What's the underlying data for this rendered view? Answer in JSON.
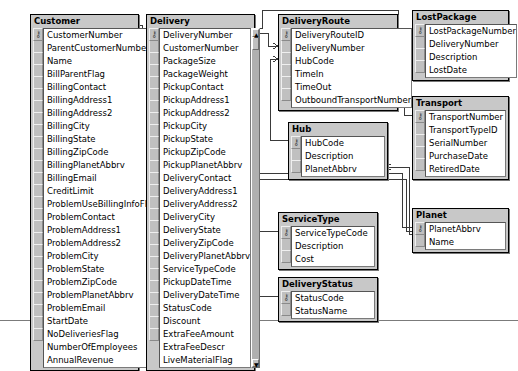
{
  "diagram": {
    "notation": "crow-foot",
    "tables": [
      {
        "name": "Customer",
        "x": 30,
        "y": 14,
        "w": 107,
        "scroll": true,
        "scroll_thumb_top": true,
        "fields": [
          {
            "name": "CustomerNumber",
            "key": true
          },
          {
            "name": "ParentCustomerNumber",
            "key": false
          },
          {
            "name": "Name",
            "key": false
          },
          {
            "name": "BillParentFlag",
            "key": false
          },
          {
            "name": "BillingContact",
            "key": false
          },
          {
            "name": "BillingAddress1",
            "key": false
          },
          {
            "name": "BillingAddress2",
            "key": false
          },
          {
            "name": "BillingCity",
            "key": false
          },
          {
            "name": "BillingState",
            "key": false
          },
          {
            "name": "BillingZipCode",
            "key": false
          },
          {
            "name": "BillingPlanetAbbrv",
            "key": false
          },
          {
            "name": "BillingEmail",
            "key": false
          },
          {
            "name": "CreditLimit",
            "key": false
          },
          {
            "name": "ProblemUseBillingInfoFlag",
            "key": false
          },
          {
            "name": "ProblemContact",
            "key": false
          },
          {
            "name": "ProblemAddress1",
            "key": false
          },
          {
            "name": "ProblemAddress2",
            "key": false
          },
          {
            "name": "ProblemCity",
            "key": false
          },
          {
            "name": "ProblemState",
            "key": false
          },
          {
            "name": "ProblemZipCode",
            "key": false
          },
          {
            "name": "ProblemPlanetAbbrv",
            "key": false
          },
          {
            "name": "ProblemEmail",
            "key": false
          },
          {
            "name": "StartDate",
            "key": false
          },
          {
            "name": "NoDeliveriesFlag",
            "key": false
          },
          {
            "name": "NumberOfEmployees",
            "key": false
          },
          {
            "name": "AnnualRevenue",
            "key": false
          }
        ]
      },
      {
        "name": "Delivery",
        "x": 146,
        "y": 14,
        "w": 107,
        "scroll": true,
        "scroll_thumb_top": true,
        "fields": [
          {
            "name": "DeliveryNumber",
            "key": true
          },
          {
            "name": "CustomerNumber",
            "key": false
          },
          {
            "name": "PackageSize",
            "key": false
          },
          {
            "name": "PackageWeight",
            "key": false
          },
          {
            "name": "PickupContact",
            "key": false
          },
          {
            "name": "PickupAddress1",
            "key": false
          },
          {
            "name": "PickupAddress2",
            "key": false
          },
          {
            "name": "PickupCity",
            "key": false
          },
          {
            "name": "PickupState",
            "key": false
          },
          {
            "name": "PickupZipCode",
            "key": false
          },
          {
            "name": "PickupPlanetAbbrv",
            "key": false
          },
          {
            "name": "DeliveryContact",
            "key": false
          },
          {
            "name": "DeliveryAddress1",
            "key": false
          },
          {
            "name": "DeliveryAddress2",
            "key": false
          },
          {
            "name": "DeliveryCity",
            "key": false
          },
          {
            "name": "DeliveryState",
            "key": false
          },
          {
            "name": "DeliveryZipCode",
            "key": false
          },
          {
            "name": "DeliveryPlanetAbbrv",
            "key": false
          },
          {
            "name": "ServiceTypeCode",
            "key": false
          },
          {
            "name": "PickupDateTime",
            "key": false
          },
          {
            "name": "DeliveryDateTime",
            "key": false
          },
          {
            "name": "StatusCode",
            "key": false
          },
          {
            "name": "Discount",
            "key": false
          },
          {
            "name": "ExtraFeeAmount",
            "key": false
          },
          {
            "name": "ExtraFeeDescr",
            "key": false
          },
          {
            "name": "LiveMaterialFlag",
            "key": false
          }
        ]
      },
      {
        "name": "DeliveryRoute",
        "x": 278,
        "y": 14,
        "w": 118,
        "scroll": false,
        "scroll_thumb_top": false,
        "fields": [
          {
            "name": "DeliveryRouteID",
            "key": true
          },
          {
            "name": "DeliveryNumber",
            "key": false
          },
          {
            "name": "HubCode",
            "key": false
          },
          {
            "name": "TimeIn",
            "key": false
          },
          {
            "name": "TimeOut",
            "key": false
          },
          {
            "name": "OutboundTransportNumber",
            "key": false
          }
        ]
      },
      {
        "name": "LostPackage",
        "x": 412,
        "y": 10,
        "w": 95,
        "scroll": false,
        "scroll_thumb_top": false,
        "fields": [
          {
            "name": "LostPackageNumber",
            "key": true
          },
          {
            "name": "DeliveryNumber",
            "key": false
          },
          {
            "name": "Description",
            "key": false
          },
          {
            "name": "LostDate",
            "key": false
          }
        ]
      },
      {
        "name": "Transport",
        "x": 412,
        "y": 96,
        "w": 95,
        "scroll": false,
        "scroll_thumb_top": false,
        "fields": [
          {
            "name": "TransportNumber",
            "key": true
          },
          {
            "name": "TransportTypeID",
            "key": false
          },
          {
            "name": "SerialNumber",
            "key": false
          },
          {
            "name": "PurchaseDate",
            "key": false
          },
          {
            "name": "RetiredDate",
            "key": false
          }
        ]
      },
      {
        "name": "Hub",
        "x": 288,
        "y": 122,
        "w": 98,
        "scroll": false,
        "scroll_thumb_top": false,
        "fields": [
          {
            "name": "HubCode",
            "key": true
          },
          {
            "name": "Description",
            "key": false
          },
          {
            "name": "PlanetAbbrv",
            "key": false
          }
        ]
      },
      {
        "name": "ServiceType",
        "x": 278,
        "y": 212,
        "w": 98,
        "scroll": false,
        "scroll_thumb_top": false,
        "fields": [
          {
            "name": "ServiceTypeCode",
            "key": true
          },
          {
            "name": "Description",
            "key": false
          },
          {
            "name": "Cost",
            "key": false
          }
        ]
      },
      {
        "name": "DeliveryStatus",
        "x": 278,
        "y": 277,
        "w": 98,
        "scroll": false,
        "scroll_thumb_top": false,
        "fields": [
          {
            "name": "StatusCode",
            "key": true
          },
          {
            "name": "StatusName",
            "key": false
          }
        ]
      },
      {
        "name": "Planet",
        "x": 412,
        "y": 208,
        "w": 95,
        "scroll": false,
        "scroll_thumb_top": false,
        "fields": [
          {
            "name": "PlanetAbbrv",
            "key": true
          },
          {
            "name": "Name",
            "key": false
          }
        ]
      }
    ],
    "relationships": [
      {
        "from": "Customer.CustomerNumber",
        "to": "Delivery.CustomerNumber",
        "from_card": "one",
        "to_card": "many"
      },
      {
        "from": "Delivery.DeliveryNumber",
        "to": "DeliveryRoute.DeliveryNumber",
        "from_card": "one",
        "to_card": "many"
      },
      {
        "from": "Delivery.DeliveryNumber",
        "to": "LostPackage.DeliveryNumber",
        "from_card": "one",
        "to_card": "many"
      },
      {
        "from": "Hub.HubCode",
        "to": "DeliveryRoute.HubCode",
        "from_card": "one",
        "to_card": "many"
      },
      {
        "from": "Transport.TransportNumber",
        "to": "DeliveryRoute.OutboundTransportNumber",
        "from_card": "one",
        "to_card": "many"
      },
      {
        "from": "ServiceType.ServiceTypeCode",
        "to": "Delivery.ServiceTypeCode",
        "from_card": "one",
        "to_card": "many"
      },
      {
        "from": "DeliveryStatus.StatusCode",
        "to": "Delivery.StatusCode",
        "from_card": "one",
        "to_card": "many"
      },
      {
        "from": "Planet.PlanetAbbrv",
        "to": "Delivery.PickupPlanetAbbrv",
        "from_card": "one",
        "to_card": "many"
      },
      {
        "from": "Planet.PlanetAbbrv",
        "to": "Delivery.DeliveryPlanetAbbrv",
        "from_card": "one",
        "to_card": "many"
      },
      {
        "from": "Planet.PlanetAbbrv",
        "to": "Hub.PlanetAbbrv",
        "from_card": "one",
        "to_card": "many"
      }
    ],
    "colors": {
      "table_bg": "#c8c8c8",
      "field_bg": "#ffffff",
      "border": "#000000",
      "line": "#3a3a3a"
    },
    "scrollbar": {
      "up_glyph": "▲",
      "down_glyph": "▼"
    }
  }
}
